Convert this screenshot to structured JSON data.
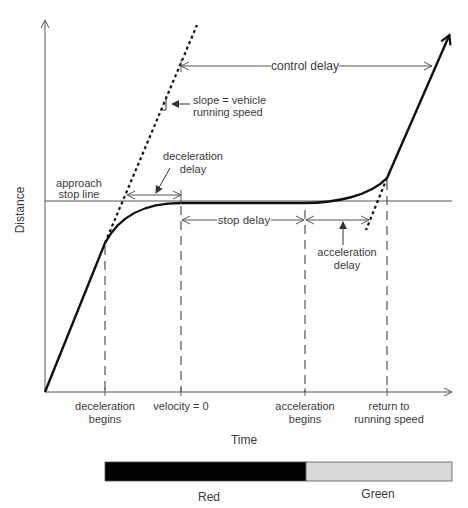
{
  "diagram": {
    "type": "time-space diagram of vehicle delay at a signalized intersection",
    "axes": {
      "y_label": "Distance",
      "x_label": "Time"
    },
    "annotations": {
      "control_delay": "control delay",
      "slope_line1": "slope = vehicle",
      "slope_line2": "running speed",
      "deceleration_delay_line1": "deceleration",
      "deceleration_delay_line2": "delay",
      "approach_stop_line_line1": "approach",
      "approach_stop_line_line2": "stop line",
      "stop_delay": "stop delay",
      "acceleration_delay_line1": "acceleration",
      "acceleration_delay_line2": "delay"
    },
    "time_markers": [
      {
        "line1": "deceleration",
        "line2": "begins"
      },
      {
        "line1": "velocity = 0",
        "line2": ""
      },
      {
        "line1": "acceleration",
        "line2": "begins"
      },
      {
        "line1": "return to",
        "line2": "running speed"
      }
    ],
    "signal_bar": {
      "phases": [
        {
          "label": "Red",
          "color": "#000000"
        },
        {
          "label": "Green",
          "color": "#d9d9d9"
        }
      ]
    },
    "colors": {
      "path": "#111111",
      "guide_lines": "#555555",
      "text": "#3a3a3a"
    }
  }
}
